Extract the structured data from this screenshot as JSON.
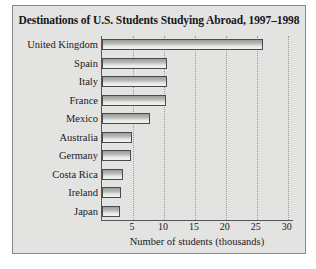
{
  "figure": {
    "background_color": "#e3e3e1",
    "border_color": "#8a8a88"
  },
  "chart_data": {
    "type": "bar",
    "orientation": "horizontal",
    "title": "Destinations of U.S. Students Studying Abroad, 1997–1998",
    "xlabel": "Number of students (thousands)",
    "ylabel": "",
    "categories": [
      "United Kingdom",
      "Spain",
      "Italy",
      "France",
      "Mexico",
      "Australia",
      "Germany",
      "Costa Rica",
      "Ireland",
      "Japan"
    ],
    "values": [
      26.0,
      10.5,
      10.5,
      10.3,
      7.8,
      4.8,
      4.7,
      3.4,
      3.0,
      2.9
    ],
    "xlim": [
      0,
      31
    ],
    "xticks": [
      5,
      10,
      15,
      20,
      25,
      30
    ],
    "xtick_labels": [
      "5",
      "10",
      "15",
      "20",
      "25",
      "30"
    ],
    "grid": "vertical-dotted",
    "legend": "none",
    "bar_fill_color": "#c8c8c6",
    "bar_edge_color": "#4a4a4e"
  }
}
